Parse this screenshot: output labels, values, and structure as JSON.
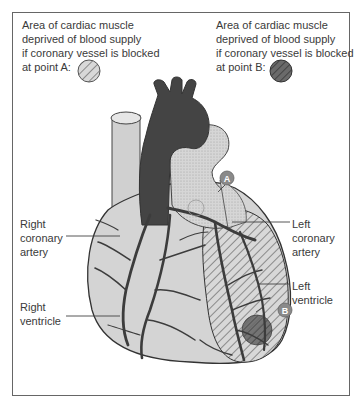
{
  "caption_a": {
    "text": "Area of cardiac muscle\ndeprived of blood supply\nif coronary vessel is blocked\nat point A:",
    "swatch": "light-hatched-circle"
  },
  "caption_b": {
    "text": "Area of cardiac muscle\ndeprived of blood supply\nif coronary vessel is blocked\nat point B:",
    "swatch": "dark-hatched-circle"
  },
  "labels": {
    "right_coronary_artery": "Right\ncoronary\nartery",
    "right_ventricle": "Right\nventricle",
    "left_coronary_artery": "Left\ncoronary\nartery",
    "left_ventricle": "Left\nventricle"
  },
  "markers": {
    "a": "A",
    "b": "B"
  },
  "colors": {
    "heart_fill": "#d4d4d4",
    "vessel": "#3c3c3c",
    "aorta": "#444444",
    "marker": "#8a8a8a",
    "frame": "#666666"
  }
}
